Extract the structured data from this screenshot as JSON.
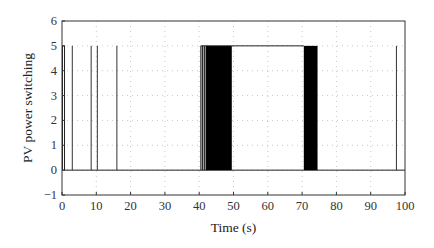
{
  "chart_data": {
    "type": "line",
    "title": "",
    "xlabel": "Time (s)",
    "ylabel": "PV power switching",
    "xlim": [
      0,
      100
    ],
    "ylim": [
      -1,
      6
    ],
    "xticks": [
      0,
      10,
      20,
      30,
      40,
      50,
      60,
      70,
      80,
      90,
      100
    ],
    "yticks": [
      -1,
      0,
      1,
      2,
      3,
      4,
      5,
      6
    ],
    "grid": "dotted",
    "legend": null,
    "series": [
      {
        "name": "PV power switching",
        "levels": [
          0,
          5
        ],
        "initial_state": {
          "t_start": 0,
          "t_end": 0.3,
          "value": 5
        },
        "spikes_to_5": [
          3,
          8.5,
          10.3,
          16,
          97.5
        ],
        "dense_switching_blocks": [
          {
            "t_start": 40.5,
            "t_end": 42.0,
            "value_range": [
              0,
              5
            ],
            "density": "sparse"
          },
          {
            "t_start": 42.0,
            "t_end": 49.5,
            "value_range": [
              0,
              5
            ],
            "density": "dense"
          },
          {
            "t_start": 70.5,
            "t_end": 74.5,
            "value_range": [
              0,
              5
            ],
            "density": "dense"
          }
        ],
        "high_plateau": {
          "t_start": 49.5,
          "t_end": 70.5,
          "value": 5
        },
        "baseline_value": 0
      }
    ]
  }
}
